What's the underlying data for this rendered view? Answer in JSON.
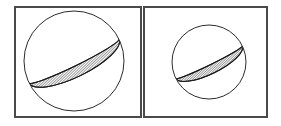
{
  "figure": {
    "background_color": "#ffffff",
    "width": 281,
    "height": 126,
    "frame_stroke_color": "#4a4a4a",
    "outline_stroke_color": "#2b2b2b",
    "hatch_stroke_color": "#1a1a1a"
  },
  "panels": [
    {
      "id": "panel-left",
      "label": "",
      "frame": {
        "x": 14,
        "y": 6,
        "width": 127,
        "height": 111
      },
      "sphere": {
        "id": "sphere-left",
        "center_x": 74,
        "center_y": 61,
        "radius": 50
      },
      "band": {
        "id": "band-left",
        "description": "hatched elliptical band tilted from lower-left to upper-right",
        "tilt_degrees": -26,
        "ellipse_rx": 50,
        "ellipse_ry": 16,
        "band_thickness": 11,
        "hatch_spacing": 1.9,
        "hatch_angle_degrees": 72
      }
    },
    {
      "id": "panel-right",
      "label": "",
      "frame": {
        "x": 143,
        "y": 6,
        "width": 124,
        "height": 111
      },
      "sphere": {
        "id": "sphere-right",
        "center_x": 209,
        "center_y": 62,
        "radius": 37
      },
      "band": {
        "id": "band-right",
        "description": "hatched elliptical band tilted from lower-left to upper-right",
        "tilt_degrees": -26,
        "ellipse_rx": 37,
        "ellipse_ry": 12,
        "band_thickness": 9,
        "hatch_spacing": 1.7,
        "hatch_angle_degrees": 72
      }
    }
  ]
}
